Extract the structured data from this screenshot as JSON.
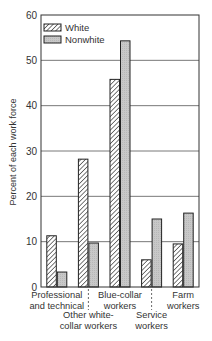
{
  "chart_data": {
    "type": "bar",
    "title": "",
    "xlabel": "",
    "ylabel": "Percent of each work force",
    "ylim": [
      0,
      60
    ],
    "yticks": [
      0,
      10,
      20,
      30,
      40,
      50,
      60
    ],
    "grid": true,
    "legend_position": "upper left",
    "categories": [
      "Professional and technical",
      "Other white-collar workers",
      "Blue-collar workers",
      "Service workers",
      "Farm workers"
    ],
    "category_label_lines": [
      [
        "Professional",
        "and technical"
      ],
      [
        "Other white-",
        "collar workers"
      ],
      [
        "Blue-collar",
        "workers"
      ],
      [
        "Service",
        "workers"
      ],
      [
        "Farm",
        "workers"
      ]
    ],
    "series": [
      {
        "name": "White",
        "pattern": "hatched",
        "values": [
          11.3,
          28.2,
          45.8,
          6.0,
          9.5
        ]
      },
      {
        "name": "Nonwhite",
        "pattern": "gray",
        "values": [
          3.3,
          9.7,
          54.3,
          15.0,
          16.3
        ]
      }
    ]
  },
  "colors": {
    "nonwhite_fill": "#c8c8c8",
    "outline": "#222222",
    "grid": "#555555"
  }
}
